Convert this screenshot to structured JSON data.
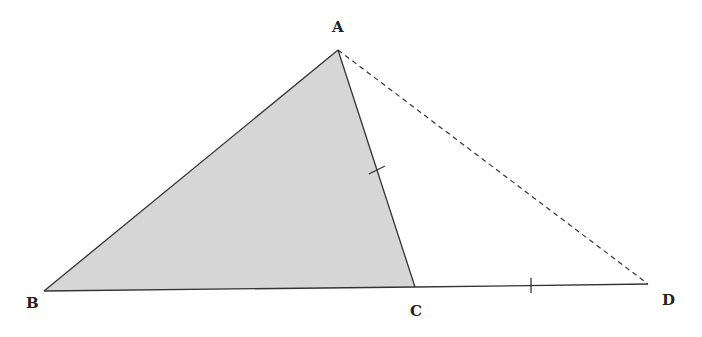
{
  "diagram": {
    "type": "geometry",
    "colors": {
      "stroke": "#333333",
      "fill": "#d6d6d6",
      "label": "#222222"
    },
    "points": {
      "A": {
        "label": "A",
        "x": 338,
        "y": 50,
        "lx": 332,
        "ly": 32
      },
      "B": {
        "label": "B",
        "x": 44,
        "y": 291,
        "lx": 26,
        "ly": 308
      },
      "C": {
        "label": "C",
        "x": 415,
        "y": 287,
        "lx": 410,
        "ly": 316
      },
      "D": {
        "label": "D",
        "x": 648,
        "y": 284,
        "lx": 662,
        "ly": 305
      }
    },
    "shaded_triangle": "ABC",
    "segments": [
      {
        "from": "A",
        "to": "B",
        "style": "solid"
      },
      {
        "from": "B",
        "to": "C",
        "style": "solid"
      },
      {
        "from": "A",
        "to": "C",
        "style": "solid",
        "tick": true
      },
      {
        "from": "C",
        "to": "D",
        "style": "solid",
        "tick": true
      },
      {
        "from": "A",
        "to": "D",
        "style": "dashed"
      }
    ]
  }
}
